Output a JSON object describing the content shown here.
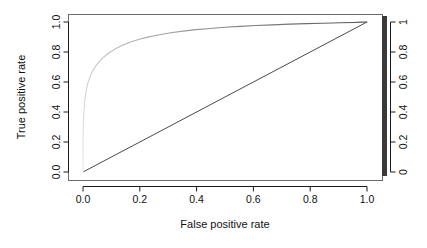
{
  "chart_data": {
    "type": "line",
    "title": "",
    "xlabel": "False positive rate",
    "ylabel": "True positive rate",
    "xlim": [
      -0.04,
      1.04
    ],
    "ylim": [
      -0.04,
      1.04
    ],
    "grid": false,
    "legend": "colorbar-right",
    "xticks": [
      "0.0",
      "0.2",
      "0.4",
      "0.6",
      "0.8",
      "1.0"
    ],
    "xtick_values": [
      0.0,
      0.2,
      0.4,
      0.6,
      0.8,
      1.0
    ],
    "yticks": [
      "0.0",
      "0.2",
      "0.4",
      "0.6",
      "0.8",
      "1.0"
    ],
    "ytick_values": [
      0.0,
      0.2,
      0.4,
      0.6,
      0.8,
      1.0
    ],
    "colorbar": {
      "label": "",
      "ticks": [
        "0",
        "0.2",
        "0.4",
        "0.6",
        "0.8",
        "1"
      ],
      "tick_values": [
        0.0,
        0.2,
        0.4,
        0.6,
        0.8,
        1.0
      ],
      "range": [
        0,
        1
      ],
      "stops": [
        {
          "pos": 0.0,
          "color": "#3a3a3a"
        },
        {
          "pos": 0.12,
          "color": "#6e6e6e"
        },
        {
          "pos": 0.28,
          "color": "#c9c9c9"
        },
        {
          "pos": 0.5,
          "color": "#e8e8e8"
        },
        {
          "pos": 0.72,
          "color": "#c9c9c9"
        },
        {
          "pos": 0.88,
          "color": "#6e6e6e"
        },
        {
          "pos": 1.0,
          "color": "#2e2e2e"
        }
      ]
    },
    "series": [
      {
        "name": "ROC curve",
        "kind": "roc",
        "color_mapped": true,
        "x": [
          0.0,
          0.0,
          0.002,
          0.004,
          0.007,
          0.011,
          0.016,
          0.023,
          0.032,
          0.043,
          0.057,
          0.073,
          0.092,
          0.114,
          0.139,
          0.167,
          0.198,
          0.232,
          0.269,
          0.309,
          0.352,
          0.398,
          0.447,
          0.499,
          0.553,
          0.609,
          0.667,
          0.726,
          0.786,
          0.846,
          0.906,
          0.955,
          0.98,
          1.0
        ],
        "y": [
          0.0,
          0.23,
          0.345,
          0.425,
          0.487,
          0.539,
          0.585,
          0.627,
          0.666,
          0.702,
          0.736,
          0.767,
          0.795,
          0.821,
          0.845,
          0.866,
          0.885,
          0.901,
          0.915,
          0.928,
          0.939,
          0.949,
          0.957,
          0.965,
          0.971,
          0.977,
          0.981,
          0.986,
          0.989,
          0.992,
          0.995,
          0.997,
          0.999,
          1.0
        ],
        "cutoff": [
          1.0,
          0.96,
          0.93,
          0.9,
          0.87,
          0.84,
          0.81,
          0.78,
          0.75,
          0.72,
          0.69,
          0.66,
          0.63,
          0.6,
          0.57,
          0.54,
          0.51,
          0.48,
          0.45,
          0.42,
          0.39,
          0.36,
          0.33,
          0.3,
          0.27,
          0.24,
          0.21,
          0.18,
          0.15,
          0.12,
          0.09,
          0.06,
          0.03,
          0.0
        ]
      },
      {
        "name": "Chance diagonal",
        "kind": "reference-line",
        "color": "#4a4a4a",
        "x": [
          0.0,
          1.0
        ],
        "y": [
          0.0,
          1.0
        ]
      }
    ]
  },
  "axes": {
    "x_title": "False positive rate",
    "y_title": "True positive rate"
  }
}
